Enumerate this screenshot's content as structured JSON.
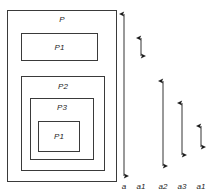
{
  "diagram": {
    "stroke_color": "#3a3a3a",
    "text_color": "#1d1d1d",
    "background_color": "#ffffff",
    "boxes": [
      {
        "id": "outer",
        "label": "P",
        "x": 7,
        "y": 10,
        "w": 110,
        "h": 172
      },
      {
        "id": "p1-top",
        "label": "P1",
        "x": 21,
        "y": 33,
        "w": 77,
        "h": 28
      },
      {
        "id": "p2",
        "label": "P2",
        "x": 21,
        "y": 76,
        "w": 84,
        "h": 95
      },
      {
        "id": "p3",
        "label": "P3",
        "x": 30,
        "y": 98,
        "w": 64,
        "h": 62
      },
      {
        "id": "p1-inner",
        "label": "P1",
        "x": 38,
        "y": 121,
        "w": 42,
        "h": 31
      }
    ],
    "arrows": [
      {
        "id": "arrow-a",
        "label": "a",
        "x": 124,
        "y1": 9,
        "y2": 181
      },
      {
        "id": "arrow-a1-top",
        "label": "a1",
        "x": 141,
        "y1": 33,
        "y2": 61
      },
      {
        "id": "arrow-a2",
        "label": "a2",
        "x": 163,
        "y1": 76,
        "y2": 171
      },
      {
        "id": "arrow-a3",
        "label": "a3",
        "x": 182,
        "y1": 98,
        "y2": 160
      },
      {
        "id": "arrow-a1-inner",
        "label": "a1",
        "x": 201,
        "y1": 121,
        "y2": 152
      }
    ],
    "axis_label_y": 182
  }
}
